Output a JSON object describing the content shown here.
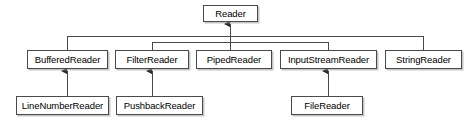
{
  "diagram": {
    "type": "class-inheritance-diagram",
    "canvas": {
      "width": 476,
      "height": 131
    },
    "style": {
      "background": "#ffffff",
      "box_fill": "#ffffff",
      "box_border": "#4a4a4a",
      "shadow": "#969696",
      "line_color": "#4a4a4a",
      "text_color": "#000000"
    },
    "nodes": [
      {
        "id": "reader",
        "label": "Reader",
        "x": 203,
        "y": 5,
        "w": 55,
        "h": 17
      },
      {
        "id": "bufferedreader",
        "label": "BufferedReader",
        "x": 27,
        "y": 50,
        "w": 81,
        "h": 19
      },
      {
        "id": "filterreader",
        "label": "FilterReader",
        "x": 115,
        "y": 50,
        "w": 74,
        "h": 19
      },
      {
        "id": "pipedreader",
        "label": "PipedReader",
        "x": 196,
        "y": 50,
        "w": 76,
        "h": 19
      },
      {
        "id": "inputstreamreader",
        "label": "InputStreamReader",
        "x": 280,
        "y": 50,
        "w": 97,
        "h": 19
      },
      {
        "id": "stringreader",
        "label": "StringReader",
        "x": 385,
        "y": 50,
        "w": 77,
        "h": 19
      },
      {
        "id": "linenumberreader",
        "label": "LineNumberReader",
        "x": 16,
        "y": 96,
        "w": 93,
        "h": 19
      },
      {
        "id": "pushbackreader",
        "label": "PushbackReader",
        "x": 116,
        "y": 96,
        "w": 87,
        "h": 19
      },
      {
        "id": "filereader",
        "label": "FileReader",
        "x": 291,
        "y": 96,
        "w": 72,
        "h": 19
      }
    ],
    "edges": [
      {
        "from": "bufferedreader",
        "to": "reader",
        "relation": "extends"
      },
      {
        "from": "filterreader",
        "to": "reader",
        "relation": "extends"
      },
      {
        "from": "pipedreader",
        "to": "reader",
        "relation": "extends"
      },
      {
        "from": "inputstreamreader",
        "to": "reader",
        "relation": "extends"
      },
      {
        "from": "stringreader",
        "to": "reader",
        "relation": "extends"
      },
      {
        "from": "linenumberreader",
        "to": "bufferedreader",
        "relation": "extends"
      },
      {
        "from": "pushbackreader",
        "to": "filterreader",
        "relation": "extends"
      },
      {
        "from": "filereader",
        "to": "inputstreamreader",
        "relation": "extends"
      }
    ],
    "geometry": {
      "bus_primary_y": 36,
      "bus_primary_x1": 67,
      "bus_primary_x2": 423,
      "bus_secondary_y": 42,
      "bus_secondary_x1": 152,
      "bus_secondary_x2": 328,
      "trunk_x": 230,
      "trunk_top_y": 22,
      "row2_top_y": 50,
      "row3_top_y": 96,
      "row2_bottom_y": 69
    }
  }
}
